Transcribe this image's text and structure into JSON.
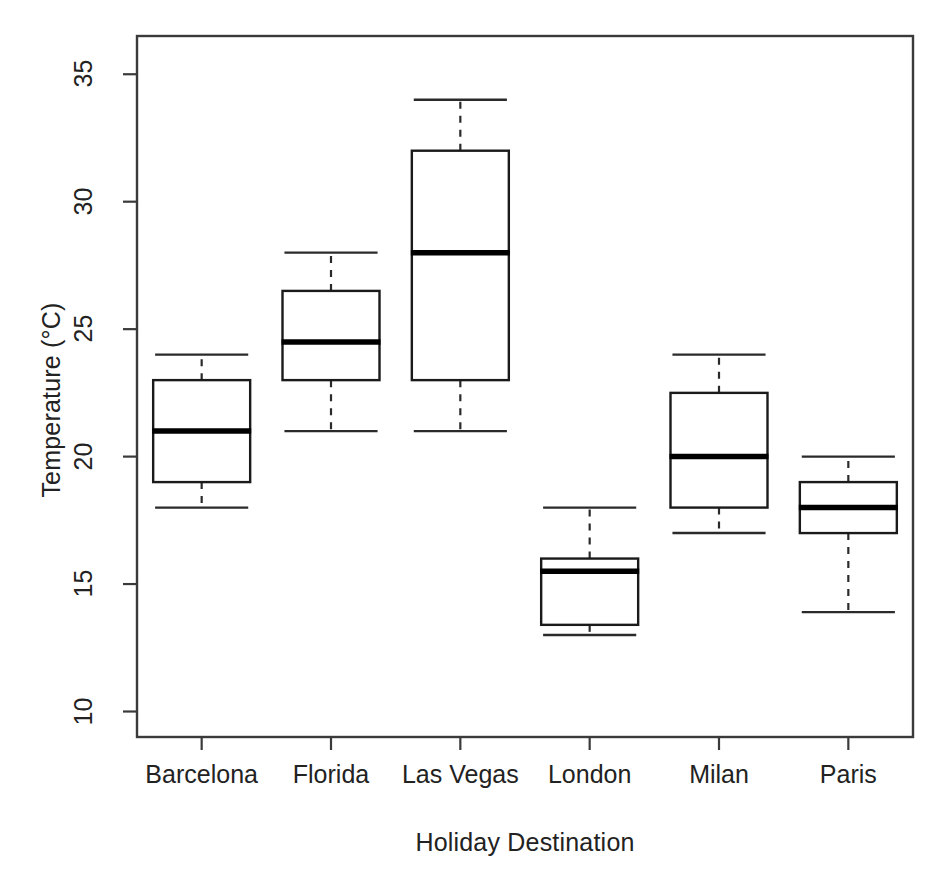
{
  "chart_data": {
    "type": "box",
    "title": "",
    "xlabel": "Holiday Destination",
    "ylabel": "Temperature (°C)",
    "categories": [
      "Barcelona",
      "Florida",
      "Las Vegas",
      "London",
      "Milan",
      "Paris"
    ],
    "ylim": [
      9,
      36.5
    ],
    "yticks": [
      10,
      15,
      20,
      25,
      30,
      35
    ],
    "ytick_labels": [
      "10",
      "15",
      "20",
      "25",
      "30",
      "35"
    ],
    "grid": false,
    "legend": null,
    "box_fill": "#ffffff",
    "box_stroke": "#1a1a1a",
    "median_color": "#000000",
    "whisker_style": "dashed",
    "boxes": [
      {
        "category": "Barcelona",
        "whisker_low": 18,
        "q1": 19,
        "median": 21,
        "q3": 23,
        "whisker_high": 24
      },
      {
        "category": "Florida",
        "whisker_low": 21,
        "q1": 23,
        "median": 24.5,
        "q3": 26.5,
        "whisker_high": 28
      },
      {
        "category": "Las Vegas",
        "whisker_low": 21,
        "q1": 23,
        "median": 28,
        "q3": 32,
        "whisker_high": 34
      },
      {
        "category": "London",
        "whisker_low": 13,
        "q1": 13.4,
        "median": 15.5,
        "q3": 16,
        "whisker_high": 18
      },
      {
        "category": "Milan",
        "whisker_low": 17,
        "q1": 18,
        "median": 20,
        "q3": 22.5,
        "whisker_high": 24
      },
      {
        "category": "Paris",
        "whisker_low": 13.9,
        "q1": 17,
        "median": 18,
        "q3": 19,
        "whisker_high": 20
      }
    ]
  },
  "axes": {
    "y_title": "Temperature (°C)",
    "x_title": "Holiday Destination"
  }
}
